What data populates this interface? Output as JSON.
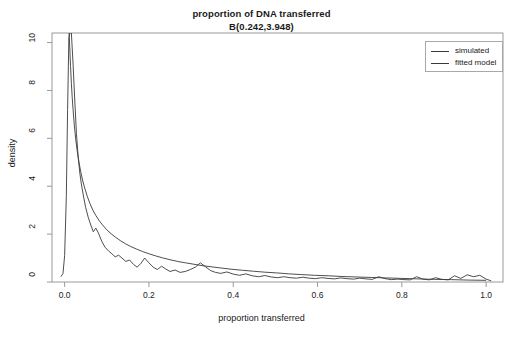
{
  "chart_data": {
    "type": "line",
    "title": "proportion of DNA transferred",
    "subtitle": "B(0.242,3.948)",
    "xlabel": "proportion transferred",
    "ylabel": "density",
    "xlim": [
      -0.03,
      1.04
    ],
    "ylim": [
      0,
      10.4
    ],
    "xticks": [
      "0.0",
      "0.2",
      "0.4",
      "0.6",
      "0.8",
      "1.0"
    ],
    "xtick_values": [
      0.0,
      0.2,
      0.4,
      0.6,
      0.8,
      1.0
    ],
    "yticks": [
      "0",
      "2",
      "4",
      "6",
      "8",
      "10"
    ],
    "ytick_values": [
      0,
      2,
      4,
      6,
      8,
      10
    ],
    "grid": false,
    "legend_position": "top-right",
    "legend": [
      "simulated",
      "fitted model"
    ],
    "distribution": "Beta",
    "alpha": 0.242,
    "beta": 3.948,
    "series": [
      {
        "name": "simulated",
        "color": "#3a3a3a",
        "x": [
          -0.009,
          -0.004,
          0.0,
          0.004,
          0.007,
          0.01,
          0.013,
          0.016,
          0.02,
          0.024,
          0.028,
          0.032,
          0.036,
          0.04,
          0.045,
          0.05,
          0.056,
          0.062,
          0.068,
          0.074,
          0.08,
          0.088,
          0.096,
          0.104,
          0.112,
          0.12,
          0.128,
          0.136,
          0.145,
          0.154,
          0.163,
          0.172,
          0.181,
          0.19,
          0.2,
          0.21,
          0.22,
          0.23,
          0.24,
          0.25,
          0.262,
          0.274,
          0.286,
          0.298,
          0.31,
          0.322,
          0.334,
          0.346,
          0.358,
          0.37,
          0.385,
          0.4,
          0.415,
          0.43,
          0.445,
          0.46,
          0.475,
          0.49,
          0.505,
          0.52,
          0.535,
          0.55,
          0.565,
          0.58,
          0.595,
          0.61,
          0.625,
          0.64,
          0.655,
          0.67,
          0.685,
          0.7,
          0.715,
          0.73,
          0.745,
          0.76,
          0.775,
          0.79,
          0.805,
          0.82,
          0.835,
          0.85,
          0.865,
          0.88,
          0.895,
          0.91,
          0.925,
          0.94,
          0.955,
          0.97,
          0.985,
          1.0,
          1.012
        ],
        "y": [
          0.22,
          0.35,
          1.1,
          3.6,
          7.2,
          10.2,
          10.45,
          10.4,
          9.1,
          7.6,
          6.2,
          5.25,
          4.55,
          4.05,
          3.55,
          3.1,
          2.7,
          2.38,
          2.1,
          2.25,
          2.05,
          1.7,
          1.45,
          1.3,
          1.18,
          1.05,
          1.12,
          1.0,
          0.86,
          0.92,
          0.74,
          0.62,
          0.78,
          1.0,
          0.8,
          0.62,
          0.52,
          0.66,
          0.54,
          0.44,
          0.5,
          0.4,
          0.44,
          0.52,
          0.62,
          0.8,
          0.64,
          0.48,
          0.4,
          0.36,
          0.42,
          0.33,
          0.28,
          0.34,
          0.26,
          0.22,
          0.27,
          0.21,
          0.18,
          0.22,
          0.18,
          0.16,
          0.2,
          0.16,
          0.14,
          0.18,
          0.15,
          0.13,
          0.17,
          0.14,
          0.12,
          0.16,
          0.13,
          0.11,
          0.22,
          0.14,
          0.1,
          0.12,
          0.1,
          0.09,
          0.22,
          0.12,
          0.09,
          0.18,
          0.11,
          0.09,
          0.26,
          0.15,
          0.3,
          0.22,
          0.28,
          0.12,
          0.05
        ]
      },
      {
        "name": "fitted model",
        "color": "#3a3a3a",
        "x": [
          0.0105,
          0.012,
          0.014,
          0.016,
          0.018,
          0.02,
          0.023,
          0.026,
          0.03,
          0.034,
          0.038,
          0.043,
          0.048,
          0.054,
          0.06,
          0.067,
          0.074,
          0.082,
          0.09,
          0.1,
          0.11,
          0.12,
          0.132,
          0.144,
          0.157,
          0.17,
          0.185,
          0.2,
          0.216,
          0.232,
          0.25,
          0.268,
          0.287,
          0.307,
          0.328,
          0.35,
          0.373,
          0.397,
          0.422,
          0.448,
          0.475,
          0.503,
          0.532,
          0.562,
          0.593,
          0.625,
          0.658,
          0.692,
          0.727,
          0.763,
          0.8,
          0.838,
          0.877,
          0.917,
          0.958,
          1.0
        ],
        "y": [
          10.4,
          9.85,
          9.0,
          8.3,
          7.7,
          7.2,
          6.55,
          6.0,
          5.45,
          5.0,
          4.62,
          4.22,
          3.9,
          3.56,
          3.28,
          3.0,
          2.78,
          2.56,
          2.38,
          2.18,
          2.02,
          1.88,
          1.73,
          1.6,
          1.48,
          1.38,
          1.27,
          1.18,
          1.09,
          1.01,
          0.93,
          0.86,
          0.8,
          0.74,
          0.68,
          0.63,
          0.58,
          0.53,
          0.49,
          0.45,
          0.41,
          0.38,
          0.34,
          0.31,
          0.28,
          0.26,
          0.23,
          0.21,
          0.19,
          0.17,
          0.15,
          0.13,
          0.11,
          0.1,
          0.08,
          0.07
        ]
      }
    ]
  },
  "axes": {
    "x_tick_labels": [
      "0.0",
      "0.2",
      "0.4",
      "0.6",
      "0.8",
      "1.0"
    ],
    "y_tick_labels": [
      "0",
      "2",
      "4",
      "6",
      "8",
      "10"
    ]
  },
  "legend": {
    "items": [
      {
        "label": "simulated"
      },
      {
        "label": "fitted model"
      }
    ]
  }
}
